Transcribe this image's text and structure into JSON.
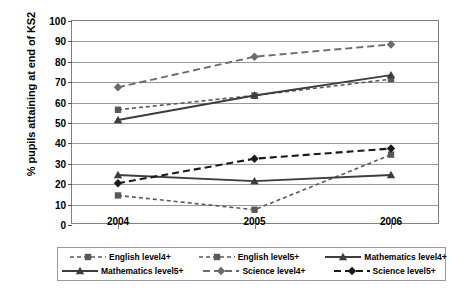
{
  "chart_data": {
    "type": "line",
    "title": "",
    "xlabel": "",
    "ylabel": "% pupils attaining at end of KS2",
    "categories": [
      "2004",
      "2005",
      "2006"
    ],
    "ylim": [
      0,
      100
    ],
    "yticks": [
      0,
      10,
      20,
      30,
      40,
      50,
      60,
      70,
      80,
      90,
      100
    ],
    "grid": true,
    "legend_position": "bottom",
    "series": [
      {
        "name": "English level4+",
        "values": [
          56,
          63,
          71
        ],
        "marker": "square",
        "dash": "4,3",
        "width": 1.6,
        "color": "#595959"
      },
      {
        "name": "English level5+",
        "values": [
          14,
          7,
          34
        ],
        "marker": "square",
        "dash": "4,3",
        "width": 1.6,
        "color": "#595959"
      },
      {
        "name": "Mathematics level4+",
        "values": [
          51,
          63,
          73
        ],
        "marker": "triangle",
        "dash": "none",
        "width": 1.9,
        "color": "#3d3d3d"
      },
      {
        "name": "Mathematics level5+",
        "values": [
          24,
          21,
          24
        ],
        "marker": "triangle",
        "dash": "none",
        "width": 1.9,
        "color": "#3d3d3d"
      },
      {
        "name": "Science level4+",
        "values": [
          67,
          82,
          88
        ],
        "marker": "diamond",
        "dash": "7,4",
        "width": 1.9,
        "color": "#6b6b6b"
      },
      {
        "name": "Science level5+",
        "values": [
          20,
          32,
          37
        ],
        "marker": "diamond",
        "dash": "7,4",
        "width": 2.1,
        "color": "#1a1a1a"
      }
    ]
  },
  "axes": {
    "y_title": "% pupils attaining at end of KS2",
    "y_tick_labels": [
      "100",
      "90",
      "80",
      "70",
      "60",
      "50",
      "40",
      "30",
      "20",
      "10",
      "0"
    ],
    "x_tick_labels": [
      "2004",
      "2005",
      "2006"
    ]
  },
  "legend": {
    "entries": [
      {
        "label": "English level4+"
      },
      {
        "label": "English level5+"
      },
      {
        "label": "Mathematics level4+"
      },
      {
        "label": "Mathematics level5+"
      },
      {
        "label": "Science level4+"
      },
      {
        "label": "Science level5+"
      }
    ]
  },
  "colors": {
    "grid": "#999999",
    "frame": "#808080",
    "text": "#000000",
    "background": "#ffffff"
  }
}
